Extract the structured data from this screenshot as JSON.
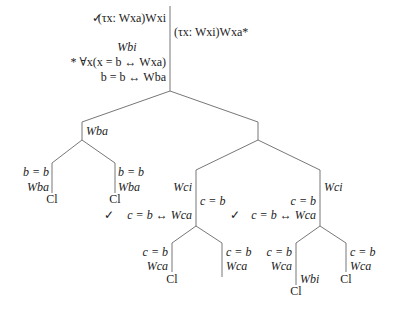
{
  "tree": {
    "root": {
      "left_column": {
        "line1_check": "✓",
        "line1": "(τx: Wxa)Wxi",
        "line2": "Wbi",
        "line3": "* ∀x(x = b ↔ Wxa)",
        "line4": "b = b ↔ Wba"
      },
      "right_column": {
        "line1": "(τx: Wxi)Wxa*"
      }
    },
    "left_branch": {
      "label": "Wba",
      "left_leaf": {
        "line1": "b = b",
        "line2": "Wba",
        "close": "Cl"
      },
      "right_leaf": {
        "line1": "b = b",
        "line2": "Wba",
        "close": "Cl"
      }
    },
    "right_branch": {
      "middle": {
        "label_left": "Wci",
        "label_right": "c = b",
        "check": "✓",
        "check_line": "c = b ↔ Wca",
        "left_leaf": {
          "line1": "c = b",
          "line2": "Wca",
          "close": "Cl"
        },
        "right_leaf": {
          "line1": "c = b",
          "line2": "Wca"
        }
      },
      "right": {
        "label_right": "Wci",
        "label_left": "c = b",
        "check": "✓",
        "check_line": "c = b ↔ Wca",
        "left_leaf": {
          "line1": "c = b",
          "line2": "Wca",
          "extra": "Wbi",
          "close": "Cl"
        },
        "right_leaf": {
          "line1": "c = b",
          "line2": "Wca",
          "close": "Cl"
        }
      }
    }
  }
}
